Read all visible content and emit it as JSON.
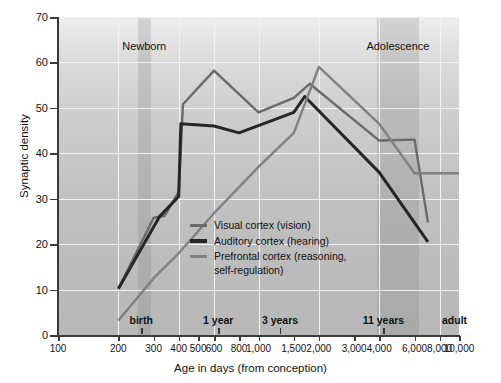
{
  "chart_data": {
    "type": "line",
    "title": "",
    "xlabel": "Age in days (from conception)",
    "ylabel": "Synaptic density",
    "xscale": "log",
    "xlim": [
      100,
      10000
    ],
    "ylim": [
      0,
      70
    ],
    "grid": true,
    "legend_position": "center",
    "xticks": [
      100,
      200,
      300,
      400,
      500,
      600,
      800,
      1000,
      1500,
      2000,
      3000,
      4000,
      6000,
      8000,
      10000
    ],
    "xticklabels": [
      "100",
      "200",
      "300",
      "400",
      "500",
      "600",
      "800",
      "1,000",
      "1,500",
      "2,000",
      "3,000",
      "4,000",
      "6,000",
      "8,000",
      "10,000"
    ],
    "yticks": [
      0,
      10,
      20,
      30,
      40,
      50,
      60,
      70
    ],
    "yticklabels": [
      "0",
      "10",
      "20",
      "30",
      "40",
      "50",
      "60",
      "70"
    ],
    "era_markers": [
      {
        "label": "birth",
        "x": 260
      },
      {
        "label": "1 year",
        "x": 630
      },
      {
        "label": "3 years",
        "x": 1280
      },
      {
        "label": "11 years",
        "x": 4200
      },
      {
        "label": "adult",
        "x": 9500
      }
    ],
    "shaded_bands": [
      {
        "label": "Newborn",
        "x_start": 250,
        "x_end": 290,
        "color": "#787878"
      },
      {
        "label": "Adolescence",
        "x_start": 3900,
        "x_end": 6300,
        "color": "#787878"
      }
    ],
    "series": [
      {
        "name": "Visual cortex (vision)",
        "color": "#6a6a6a",
        "width": 2.4,
        "x": [
          200,
          300,
          340,
          400,
          420,
          600,
          1000,
          1500,
          1800,
          4000,
          6000,
          7000
        ],
        "values": [
          10.2,
          25.8,
          26.2,
          31.5,
          50.8,
          58.2,
          49.0,
          52.2,
          55.3,
          42.8,
          43.0,
          24.8
        ]
      },
      {
        "name": "Auditory cortex (hearing)",
        "color": "#262626",
        "width": 3.0,
        "x": [
          200,
          320,
          400,
          410,
          600,
          800,
          1500,
          1700,
          4000,
          7000
        ],
        "values": [
          10.2,
          26.0,
          30.5,
          46.5,
          46.0,
          44.5,
          49.0,
          52.5,
          35.8,
          20.5
        ]
      },
      {
        "name": "Prefrontal cortex (reasoning, self-regulation)",
        "color": "#808080",
        "width": 2.4,
        "x": [
          200,
          300,
          400,
          600,
          1000,
          1500,
          2000,
          4000,
          6000,
          10000
        ],
        "values": [
          3.2,
          12.5,
          18.0,
          26.8,
          37.0,
          44.5,
          59.0,
          46.5,
          35.6,
          35.6
        ]
      }
    ]
  },
  "legend": {
    "items": [
      {
        "label": "Visual cortex (vision)",
        "color": "#6a6a6a"
      },
      {
        "label": "Auditory cortex (hearing)",
        "color": "#262626"
      },
      {
        "label": "Prefrontal cortex (reasoning,\nself-regulation)",
        "color": "#808080"
      }
    ]
  }
}
